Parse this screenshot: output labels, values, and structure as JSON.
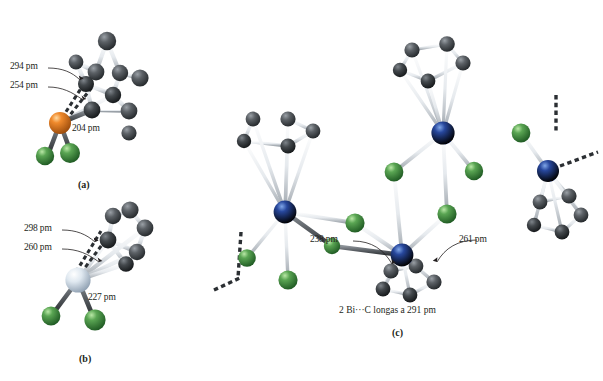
{
  "figure": {
    "type": "molecular-structure-diagram",
    "background": "#ffffff",
    "panels": [
      {
        "id": "a",
        "letter": "(a)",
        "center_atom": {
          "element": "metal",
          "color": "#e8822a"
        },
        "labels": [
          {
            "text": "294 pm",
            "kind": "dashed-contact"
          },
          {
            "text": "254 pm",
            "kind": "dashed-contact"
          },
          {
            "text": "204 pm",
            "kind": "bond"
          }
        ]
      },
      {
        "id": "b",
        "letter": "(b)",
        "center_atom": {
          "element": "metal",
          "color": "#cfdbe6"
        },
        "labels": [
          {
            "text": "298 pm",
            "kind": "dashed-contact"
          },
          {
            "text": "260 pm",
            "kind": "dashed-contact"
          },
          {
            "text": "227 pm",
            "kind": "bond"
          }
        ]
      },
      {
        "id": "c",
        "letter": "(c)",
        "center_atom": {
          "element": "Bi",
          "color": "#1d3b8c"
        },
        "labels": [
          {
            "text": "238 pm",
            "kind": "bond"
          },
          {
            "text": "261 pm",
            "kind": "bond"
          }
        ],
        "note": "2 Bi···C longas a 291 pm"
      }
    ],
    "colors": {
      "carbon": "#4a4f55",
      "carbon_dark": "#2b2f33",
      "halide_green": "#4c9a4c",
      "halide_green_dark": "#2f6b2f",
      "metal_orange": "#e8822a",
      "metal_pale": "#cfdbe6",
      "metal_blue": "#1d3b8c",
      "bond_light": "#e9ecef",
      "bond_outline": "#8d9399",
      "bond_dark": "#54585c",
      "text": "#231f20",
      "dashed": "#2b2f33"
    },
    "units": "pm"
  }
}
